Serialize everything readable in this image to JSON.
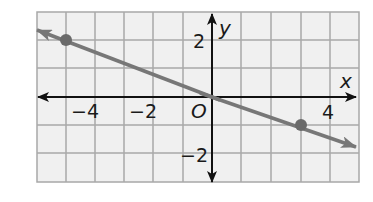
{
  "graph": {
    "x_axis_label": "x",
    "y_axis_label": "y",
    "origin_label": "O",
    "x_tick_labels": [
      {
        "value": -4,
        "text": "−4"
      },
      {
        "value": -2,
        "text": "−2"
      },
      {
        "value": 4,
        "text": "4"
      }
    ],
    "y_tick_labels": [
      {
        "value": 2,
        "text": "2"
      },
      {
        "value": -2,
        "text": "−2"
      }
    ],
    "x_range": [
      -6,
      5
    ],
    "y_range": [
      -3,
      3
    ],
    "points": [
      {
        "x": -5,
        "y": 2
      },
      {
        "x": 3,
        "y": -1
      }
    ],
    "line": {
      "description": "line through origin with negative slope, arrows on both ends"
    },
    "colors": {
      "grid_background": "#f0f0f0",
      "grid_lines": "#a8a8a8",
      "axes": "#111111",
      "line": "#777777",
      "points": "#6a6a6a"
    }
  }
}
